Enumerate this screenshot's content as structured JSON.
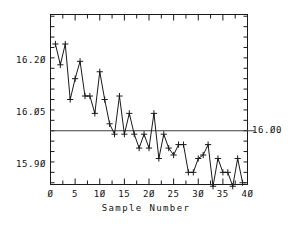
{
  "chart_data": {
    "type": "line",
    "title": "",
    "subtitle": "",
    "xlabel": "Sample Number",
    "ylabel": "",
    "xlim": [
      0,
      40
    ],
    "ylim": [
      15.845,
      16.335
    ],
    "grid": false,
    "legend": null,
    "marker": "plus",
    "x": [
      1,
      2,
      3,
      4,
      5,
      6,
      7,
      8,
      9,
      10,
      11,
      12,
      13,
      14,
      15,
      16,
      17,
      18,
      19,
      20,
      21,
      22,
      23,
      24,
      25,
      26,
      27,
      28,
      29,
      30,
      31,
      32,
      33,
      34,
      35,
      36,
      37,
      38,
      39
    ],
    "values": [
      16.25,
      16.19,
      16.25,
      16.09,
      16.15,
      16.2,
      16.1,
      16.1,
      16.05,
      16.17,
      16.09,
      16.02,
      15.99,
      16.1,
      15.99,
      16.05,
      15.99,
      15.95,
      15.99,
      15.95,
      16.05,
      15.92,
      15.99,
      15.95,
      15.93,
      15.96,
      15.96,
      15.88,
      15.88,
      15.92,
      15.93,
      15.96,
      15.84,
      15.92,
      15.88,
      15.88,
      15.84,
      15.92,
      15.85
    ],
    "series": [
      {
        "name": "Sample measurement",
        "values": [
          16.25,
          16.19,
          16.25,
          16.09,
          16.15,
          16.2,
          16.1,
          16.1,
          16.05,
          16.17,
          16.09,
          16.02,
          15.99,
          16.1,
          15.99,
          16.05,
          15.99,
          15.95,
          15.99,
          15.95,
          16.05,
          15.92,
          15.99,
          15.95,
          15.93,
          15.96,
          15.96,
          15.88,
          15.88,
          15.92,
          15.93,
          15.96,
          15.84,
          15.92,
          15.88,
          15.88,
          15.84,
          15.92,
          15.85
        ]
      }
    ],
    "reference_lines": [
      {
        "name": "target",
        "value": 16.0,
        "label": "16.Ø0",
        "orientation": "horizontal"
      }
    ],
    "y_ticks": [
      {
        "value": 16.2,
        "label": "16.2Ø"
      },
      {
        "value": 16.05,
        "label": "16.Ø5"
      },
      {
        "value": 15.9,
        "label": "15.9Ø"
      }
    ],
    "y_minor_tick_count": 17,
    "x_ticks": [
      {
        "value": 0,
        "label": "Ø"
      },
      {
        "value": 5,
        "label": "5"
      },
      {
        "value": 10,
        "label": "1Ø"
      },
      {
        "value": 15,
        "label": "15"
      },
      {
        "value": 20,
        "label": "2Ø"
      },
      {
        "value": 25,
        "label": "25"
      },
      {
        "value": 30,
        "label": "3Ø"
      },
      {
        "value": 35,
        "label": "35"
      },
      {
        "value": 40,
        "label": "4Ø"
      }
    ],
    "x_minor_tick_step": 2.5,
    "colors": {
      "background": "#ffffff",
      "axis": "#1a1a1a",
      "series": "#1a1a1a",
      "reference_line": "#3d3d3d",
      "text": "#111111"
    }
  },
  "axis_title": {
    "x": "Sample Number"
  }
}
